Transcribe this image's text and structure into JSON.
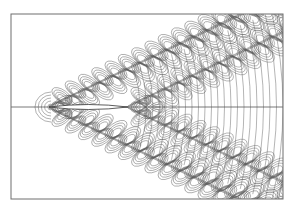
{
  "figure": {
    "type": "contour-plot",
    "frame": {
      "x": 11,
      "y": 14,
      "width": 272,
      "height": 185,
      "stroke": "#6e6e6e"
    },
    "centerline": {
      "y": 107,
      "stroke": "#555555"
    },
    "hull": {
      "bow_x": 49,
      "stern_x": 128,
      "half_beam": 2.5
    },
    "contour_color": "#5a5a5a",
    "wake_half_angle_deg": 19.5,
    "bow_wave": {
      "origin_x": 49,
      "wavelength": 13.5,
      "crest_count": 18
    },
    "stern_wave": {
      "origin_x": 128,
      "wavelength": 13.5,
      "crest_count": 12
    },
    "transverse_waves": {
      "start_x": 140,
      "spacing": 6.5
    }
  }
}
